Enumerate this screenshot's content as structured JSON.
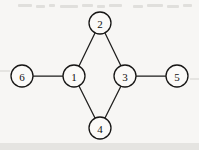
{
  "figure": {
    "kind": "undirected-graph-diagram",
    "width": 199,
    "height": 150,
    "background_color": "#f7f6f4",
    "ink_color": "#1d1c1b",
    "node_fill_color": "#fbfaf8",
    "node_radius": 11,
    "node_count": 6,
    "edge_count": 6
  },
  "nodes": [
    {
      "id": "1",
      "label": "1",
      "cx": 74,
      "cy": 76,
      "r": 11
    },
    {
      "id": "2",
      "label": "2",
      "cx": 100,
      "cy": 23,
      "r": 11
    },
    {
      "id": "3",
      "label": "3",
      "cx": 125,
      "cy": 76,
      "r": 11
    },
    {
      "id": "4",
      "label": "4",
      "cx": 100,
      "cy": 128,
      "r": 11
    },
    {
      "id": "5",
      "label": "5",
      "cx": 177,
      "cy": 76,
      "r": 11
    },
    {
      "id": "6",
      "label": "6",
      "cx": 22,
      "cy": 76,
      "r": 11
    }
  ],
  "edges": [
    {
      "id": "edge-6-1",
      "from": "6",
      "to": "1",
      "x1": 33,
      "y1": 76,
      "x2": 63,
      "y2": 76
    },
    {
      "id": "edge-1-2",
      "from": "1",
      "to": "2",
      "x1": 79,
      "y1": 66,
      "x2": 95,
      "y2": 33
    },
    {
      "id": "edge-2-3",
      "from": "2",
      "to": "3",
      "x1": 105,
      "y1": 33,
      "x2": 121,
      "y2": 66
    },
    {
      "id": "edge-3-5",
      "from": "3",
      "to": "5",
      "x1": 136,
      "y1": 76,
      "x2": 166,
      "y2": 76
    },
    {
      "id": "edge-1-4",
      "from": "1",
      "to": "4",
      "x1": 79,
      "y1": 86,
      "x2": 95,
      "y2": 118
    },
    {
      "id": "edge-4-3",
      "from": "4",
      "to": "3",
      "x1": 105,
      "y1": 118,
      "x2": 121,
      "y2": 86
    }
  ],
  "artifacts": {
    "description": "faint scanner speckle band across the top margin",
    "marks": [
      {
        "x": 18,
        "y": 4,
        "w": 14,
        "h": 3
      },
      {
        "x": 36,
        "y": 5,
        "w": 9,
        "h": 3
      },
      {
        "x": 49,
        "y": 4,
        "w": 6,
        "h": 3
      },
      {
        "x": 60,
        "y": 5,
        "w": 18,
        "h": 3
      },
      {
        "x": 82,
        "y": 4,
        "w": 11,
        "h": 3
      },
      {
        "x": 97,
        "y": 5,
        "w": 8,
        "h": 3
      },
      {
        "x": 109,
        "y": 4,
        "w": 13,
        "h": 3
      },
      {
        "x": 133,
        "y": 5,
        "w": 10,
        "h": 3
      },
      {
        "x": 147,
        "y": 4,
        "w": 16,
        "h": 3
      },
      {
        "x": 167,
        "y": 5,
        "w": 12,
        "h": 3
      },
      {
        "x": 183,
        "y": 4,
        "w": 9,
        "h": 3
      }
    ],
    "smudges": [
      {
        "x": 0,
        "y": 70,
        "w": 10,
        "h": 2
      },
      {
        "x": 190,
        "y": 78,
        "w": 9,
        "h": 2
      },
      {
        "x": 0,
        "y": 143,
        "w": 199,
        "h": 7
      }
    ]
  }
}
